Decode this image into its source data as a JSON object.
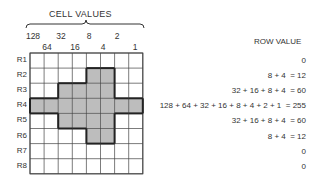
{
  "diagram": {
    "cell_values_title": "CELL VALUES",
    "row_value_title": "ROW VALUE",
    "column_values_top": [
      "128",
      "32",
      "8",
      "2"
    ],
    "column_values_bottom": [
      "64",
      "16",
      "4",
      "1"
    ],
    "rows": [
      {
        "label": "R1",
        "cells": [
          0,
          0,
          0,
          0,
          0,
          0,
          0,
          0
        ],
        "expression": "",
        "value": "0"
      },
      {
        "label": "R2",
        "cells": [
          0,
          0,
          0,
          0,
          1,
          1,
          0,
          0
        ],
        "expression": "8 + 4  =",
        "value": "12"
      },
      {
        "label": "R3",
        "cells": [
          0,
          0,
          1,
          1,
          1,
          1,
          0,
          0
        ],
        "expression": "32 + 16 + 8 + 4  =",
        "value": "60"
      },
      {
        "label": "R4",
        "cells": [
          1,
          1,
          1,
          1,
          1,
          1,
          1,
          1
        ],
        "expression": "128 + 64 + 32 + 16 + 8 + 4 + 2 + 1  =",
        "value": "255"
      },
      {
        "label": "R5",
        "cells": [
          0,
          0,
          1,
          1,
          1,
          1,
          0,
          0
        ],
        "expression": "32 + 16 + 8 + 4  =",
        "value": "60"
      },
      {
        "label": "R6",
        "cells": [
          0,
          0,
          0,
          0,
          1,
          1,
          0,
          0
        ],
        "expression": "8 + 4  =",
        "value": "12"
      },
      {
        "label": "R7",
        "cells": [
          0,
          0,
          0,
          0,
          0,
          0,
          0,
          0
        ],
        "expression": "",
        "value": "0"
      },
      {
        "label": "R8",
        "cells": [
          0,
          0,
          0,
          0,
          0,
          0,
          0,
          0
        ],
        "expression": "",
        "value": "0"
      }
    ],
    "colors": {
      "fill": "#bdbdbd",
      "grid": "#444444",
      "outline": "#222222"
    }
  }
}
